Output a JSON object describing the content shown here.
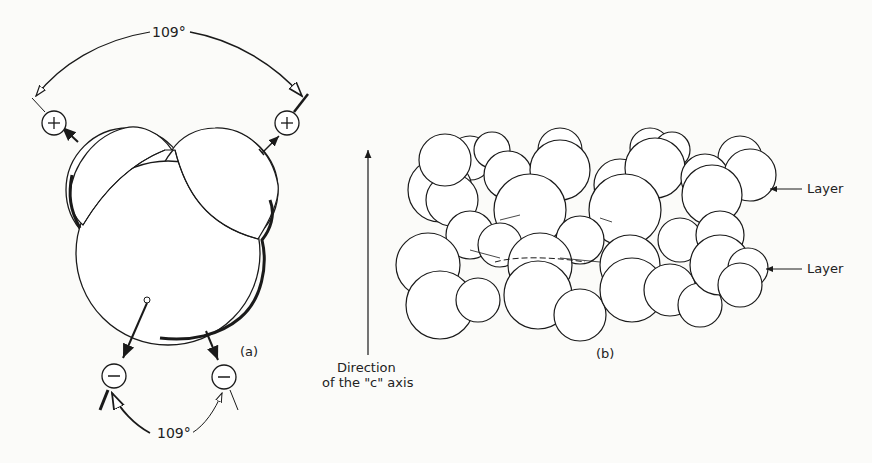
{
  "figure": {
    "panel_a": {
      "label": "(a)",
      "top_angle": "109°",
      "bottom_angle": "109°",
      "positive_charge_symbol": "+",
      "negative_charge_symbol": "−"
    },
    "axis": {
      "label_line1": "Direction",
      "label_line2": "of the \"c\" axis"
    },
    "panel_b": {
      "label": "(b)",
      "layer_labels": [
        "Layer",
        "Layer"
      ]
    }
  }
}
